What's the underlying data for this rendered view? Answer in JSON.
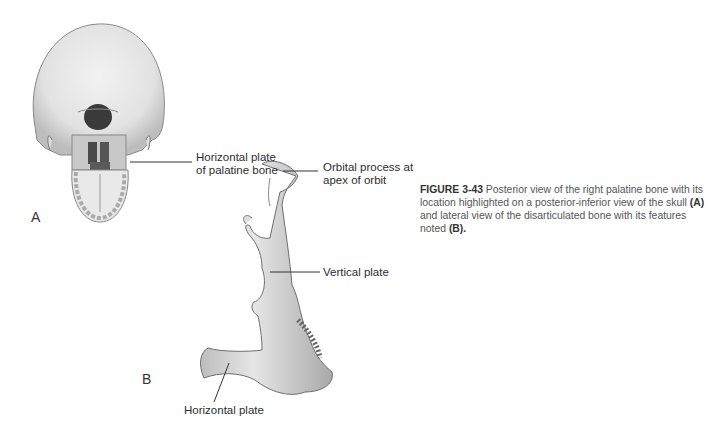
{
  "figure": {
    "number": "FIGURE 3-43",
    "caption_parts": [
      {
        "text": " Posterior view of the right palatine bone with its location highlighted on a posterior-inferior view of the skull ",
        "bold": false
      },
      {
        "text": "(A)",
        "bold": true
      },
      {
        "text": " and lateral view of the disarticulated bone with its features noted ",
        "bold": false
      },
      {
        "text": "(B).",
        "bold": true
      }
    ]
  },
  "panel_a": {
    "letter": "A",
    "illustration": "skull-posterior-inferior-view",
    "labels": [
      {
        "line1": "Horizontal plate",
        "line2": "of palatine bone"
      }
    ]
  },
  "panel_b": {
    "letter": "B",
    "illustration": "palatine-bone-lateral-view",
    "labels": [
      {
        "line1": "Orbital process at",
        "line2": "apex of orbit"
      },
      {
        "line1": "Vertical plate"
      },
      {
        "line1": "Horizontal plate"
      }
    ]
  }
}
